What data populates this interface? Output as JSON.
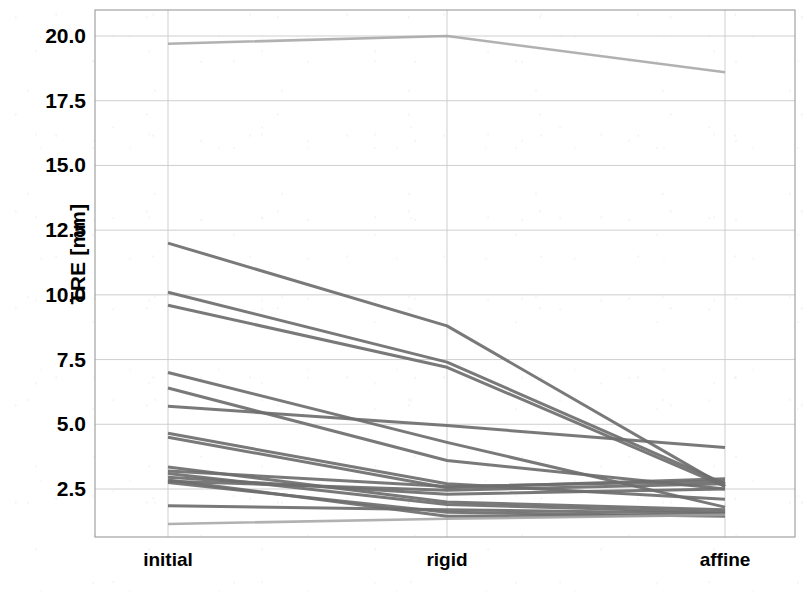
{
  "chart_data": {
    "type": "line",
    "title": "",
    "xlabel": "",
    "ylabel": "TRE [mm]",
    "categories": [
      "initial",
      "rigid",
      "affine"
    ],
    "xtick_labels": [
      "initial",
      "rigid",
      "affine"
    ],
    "ytick_labels": [
      "20.0",
      "17.5",
      "15.0",
      "12.5",
      "10.0",
      "7.5",
      "5.0",
      "2.5"
    ],
    "ytick_values": [
      20.0,
      17.5,
      15.0,
      12.5,
      10.0,
      7.5,
      5.0,
      2.5
    ],
    "ylim": [
      0.85,
      21.3
    ],
    "xlim": [
      0,
      1
    ],
    "grid": true,
    "legend": false,
    "legend_position": "none",
    "line_color": "#6e6e6e",
    "grid_color": "#c9c9c9",
    "axis_color": "#8a8a8a",
    "background_color": "#ffffff",
    "series": [
      {
        "name": "case-01",
        "values": [
          19.7,
          20.0,
          18.6
        ]
      },
      {
        "name": "case-02",
        "values": [
          12.0,
          8.8,
          2.6
        ]
      },
      {
        "name": "case-03",
        "values": [
          10.1,
          7.4,
          2.7
        ]
      },
      {
        "name": "case-04",
        "values": [
          9.6,
          7.2,
          2.6
        ]
      },
      {
        "name": "case-05",
        "values": [
          7.0,
          4.3,
          1.8
        ]
      },
      {
        "name": "case-06",
        "values": [
          6.4,
          3.6,
          2.5
        ]
      },
      {
        "name": "case-07",
        "values": [
          5.7,
          4.95,
          4.1
        ]
      },
      {
        "name": "case-08",
        "values": [
          4.65,
          2.7,
          2.1
        ]
      },
      {
        "name": "case-09",
        "values": [
          4.5,
          2.55,
          2.9
        ]
      },
      {
        "name": "case-10",
        "values": [
          3.35,
          2.0,
          1.7
        ]
      },
      {
        "name": "case-11",
        "values": [
          3.2,
          2.6,
          2.8
        ]
      },
      {
        "name": "case-12",
        "values": [
          3.1,
          1.9,
          1.6
        ]
      },
      {
        "name": "case-13",
        "values": [
          2.95,
          2.3,
          2.5
        ]
      },
      {
        "name": "case-14",
        "values": [
          2.85,
          1.45,
          1.5
        ]
      },
      {
        "name": "case-15",
        "values": [
          2.8,
          2.45,
          2.7
        ]
      },
      {
        "name": "case-16",
        "values": [
          2.75,
          1.6,
          1.45
        ]
      },
      {
        "name": "case-17",
        "values": [
          1.85,
          1.7,
          1.55
        ]
      },
      {
        "name": "case-18",
        "values": [
          1.15,
          1.35,
          1.5
        ]
      }
    ]
  }
}
